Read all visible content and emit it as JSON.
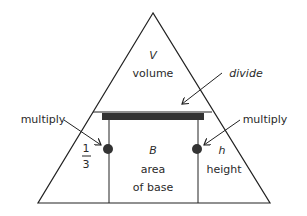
{
  "diagram": {
    "top": {
      "symbol": "V",
      "label": "volume"
    },
    "divide_label": "divide",
    "left": {
      "multiply_label": "multiply",
      "numerator": "1",
      "denominator": "3"
    },
    "center": {
      "symbol": "B",
      "line1": "area",
      "line2": "of base"
    },
    "right": {
      "multiply_label": "multiply",
      "symbol": "h",
      "label": "height"
    },
    "colors": {
      "stroke": "#222222",
      "bar": "#333333",
      "text": "#2a2a2a"
    }
  }
}
